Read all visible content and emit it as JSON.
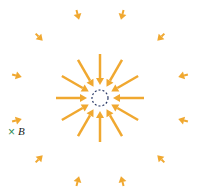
{
  "diagram": {
    "center": {
      "x": 100,
      "y": 98
    },
    "circle": {
      "radius": 8,
      "stroke": "#2b3a67",
      "dash": "2,2"
    },
    "arrow_color": "#f0a830",
    "inner_arrows": {
      "count": 12,
      "r_outer": 44,
      "r_inner": 13
    },
    "outer_arrows": {
      "count": 12,
      "radius": 86,
      "length": 10,
      "offset_deg": 15
    },
    "point_b": {
      "label": "B",
      "marker": "×",
      "marker_color": "#2e8b57",
      "x": 21,
      "y": 133
    }
  }
}
